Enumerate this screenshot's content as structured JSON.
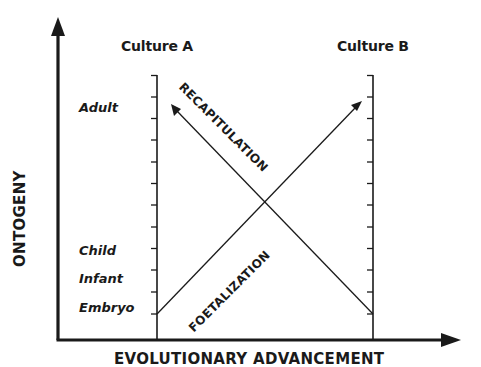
{
  "diagram": {
    "x_axis": {
      "label": "EVOLUTIONARY ADVANCEMENT"
    },
    "y_axis": {
      "label": "ONTOGENY"
    },
    "cultures": [
      {
        "id": "culture-a",
        "label": "Culture A"
      },
      {
        "id": "culture-b",
        "label": "Culture B"
      }
    ],
    "stages": [
      {
        "id": "adult",
        "label": "Adult"
      },
      {
        "id": "child",
        "label": "Child"
      },
      {
        "id": "infant",
        "label": "Infant"
      },
      {
        "id": "embryo",
        "label": "Embryo"
      }
    ],
    "processes": [
      {
        "id": "recapitulation",
        "label": "RECAPITULATION",
        "from": "Culture B / Embryo",
        "to": "Culture A / Adult"
      },
      {
        "id": "foetalization",
        "label": "FOETALIZATION",
        "from": "Culture A / Embryo",
        "to": "Culture B / Adult"
      }
    ],
    "tick_count": 12,
    "colors": {
      "ink": "#1a1a1a",
      "background": "#ffffff"
    }
  }
}
